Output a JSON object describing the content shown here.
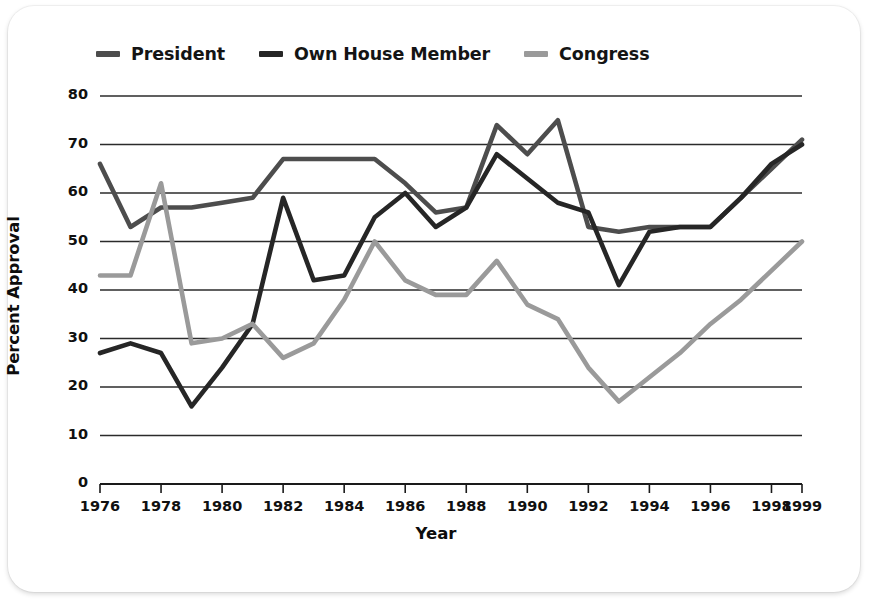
{
  "figure": {
    "background_color": "#ffffff",
    "axis_color": "#1a1a1a",
    "grid_color": "#2b2b2b"
  },
  "legend": {
    "position": "top-left",
    "items": [
      {
        "label": "President",
        "color": "#4d4d4d",
        "swatch_name": "legend-swatch-president"
      },
      {
        "label": "Own House Member",
        "color": "#262626",
        "swatch_name": "legend-swatch-own-house-member"
      },
      {
        "label": "Congress",
        "color": "#9a9a9a",
        "swatch_name": "legend-swatch-congress"
      }
    ]
  },
  "chart_data": {
    "type": "line",
    "title": "",
    "subtitle": "",
    "xlabel": "Year",
    "ylabel": "Percent Approval",
    "xlim": [
      1976,
      1999
    ],
    "ylim": [
      0,
      80
    ],
    "grid": true,
    "grid_axis": "y",
    "legend_position": "top-left",
    "yticks": [
      0,
      10,
      20,
      30,
      40,
      50,
      60,
      70,
      80
    ],
    "ytick_labels": [
      "0",
      "10",
      "20",
      "30",
      "40",
      "50",
      "60",
      "70",
      "80"
    ],
    "xticks": [
      1976,
      1978,
      1980,
      1982,
      1984,
      1986,
      1988,
      1990,
      1992,
      1994,
      1996,
      1998,
      1999
    ],
    "xtick_labels": [
      "1976",
      "1978",
      "1980",
      "1982",
      "1984",
      "1986",
      "1988",
      "1990",
      "1992",
      "1994",
      "1996",
      "1998",
      "1999"
    ],
    "x": [
      1976,
      1977,
      1978,
      1979,
      1980,
      1981,
      1982,
      1983,
      1984,
      1985,
      1986,
      1987,
      1988,
      1989,
      1990,
      1991,
      1992,
      1993,
      1994,
      1995,
      1996,
      1997,
      1998,
      1999
    ],
    "series": [
      {
        "name": "President",
        "color": "#4d4d4d",
        "values": [
          66,
          53,
          57,
          57,
          58,
          59,
          67,
          67,
          67,
          67,
          62,
          56,
          57,
          74,
          68,
          75,
          53,
          52,
          53,
          53,
          53,
          59,
          65,
          71
        ]
      },
      {
        "name": "Own House Member",
        "color": "#262626",
        "values": [
          27,
          29,
          27,
          16,
          24,
          33,
          59,
          42,
          43,
          55,
          60,
          53,
          57,
          68,
          63,
          58,
          56,
          41,
          52,
          53,
          53,
          59,
          66,
          70
        ]
      },
      {
        "name": "Congress",
        "color": "#9a9a9a",
        "values": [
          43,
          43,
          62,
          29,
          30,
          33,
          26,
          29,
          38,
          50,
          42,
          39,
          39,
          46,
          37,
          34,
          24,
          17,
          22,
          27,
          33,
          38,
          44,
          50
        ]
      }
    ]
  }
}
